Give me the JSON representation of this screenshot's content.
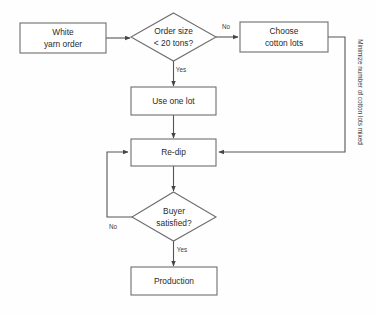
{
  "diagram": {
    "background_color": "#fefefe",
    "stroke_color": "#6e6e6e",
    "text_color": "#2b2b2b",
    "nodes": {
      "white_yarn_order": {
        "label_line1": "White",
        "label_line2": "yarn order",
        "shape": "rectangle"
      },
      "order_size": {
        "label_line1": "Order size",
        "label_line2": "< 20 tons?",
        "shape": "diamond"
      },
      "choose_cotton_lots": {
        "label_line1": "Choose",
        "label_line2": "cotton lots",
        "shape": "rectangle"
      },
      "use_one_lot": {
        "label": "Use one lot",
        "shape": "rectangle"
      },
      "re_dip": {
        "label": "Re-dip",
        "shape": "rectangle"
      },
      "buyer_satisfied": {
        "label_line1": "Buyer",
        "label_line2": "satisfied?",
        "shape": "diamond"
      },
      "production": {
        "label": "Production",
        "shape": "rectangle"
      }
    },
    "edge_labels": {
      "order_size_no": "No",
      "order_size_yes": "Yes",
      "buyer_no": "No",
      "buyer_yes": "Yes"
    },
    "annotations": {
      "minimize_note": "Minimize number of cotton lots mixed"
    }
  }
}
